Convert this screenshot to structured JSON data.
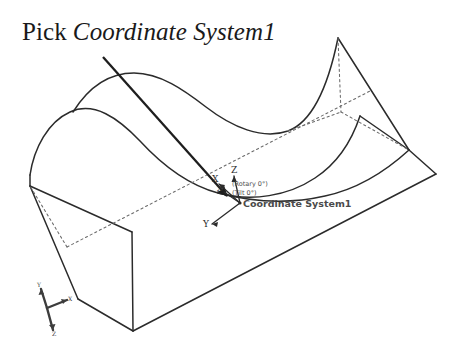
{
  "figure": {
    "name": "coordinate-system-pick-illustration",
    "background_color": "#ffffff",
    "line_color": "#2b2b2b",
    "hidden_line_color": "#5a5a5a",
    "width": 459,
    "height": 344
  },
  "title": {
    "plain_part": "Pick",
    "italic_part": "Coordinate System1",
    "full": "Pick Coordinate System1"
  },
  "leader_arrow": {
    "name": "leader-arrow",
    "start_x": 103,
    "start_y": 57,
    "end_x": 232,
    "end_y": 200
  },
  "coordinate_system": {
    "name_label": "Coordinate System1",
    "rotary_label": "(Rotary 0°)",
    "tilt_label": "(Tilt 0°)",
    "origin_x": 240,
    "origin_y": 203,
    "axes": [
      {
        "label": "Z",
        "name": "z-axis"
      },
      {
        "label": "X",
        "name": "x-axis-upper"
      },
      {
        "label": "X",
        "name": "x-axis-lower"
      },
      {
        "label": "Y",
        "name": "y-axis"
      }
    ]
  },
  "view_triad": {
    "name": "view-orientation-triad",
    "origin_x": 47,
    "origin_y": 308,
    "axes": [
      {
        "label": "Y",
        "name": "triad-y-axis"
      },
      {
        "label": "X",
        "name": "triad-x-axis"
      },
      {
        "label": "Z",
        "name": "triad-z-axis"
      }
    ]
  },
  "solid": {
    "name": "wavy-top-block",
    "description": "Rectangular block with sinusoidal wavy top surface shown in isometric view"
  }
}
